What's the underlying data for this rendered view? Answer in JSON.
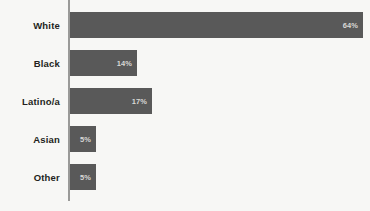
{
  "chart_data": {
    "type": "bar",
    "orientation": "horizontal",
    "title": "",
    "subtitle": "",
    "xlabel": "",
    "ylabel": "",
    "grid": false,
    "legend": false,
    "xlim": [
      0,
      64
    ],
    "categories": [
      "White",
      "Black",
      "Latino/a",
      "Asian",
      "Other"
    ],
    "values": [
      64,
      14,
      17,
      5,
      5
    ],
    "value_labels": [
      "64%",
      "14%",
      "17%",
      "5%",
      "5%"
    ],
    "series": [
      {
        "name": "",
        "values": [
          64,
          14,
          17,
          5,
          5
        ]
      }
    ],
    "colors": {
      "bar": "#595959",
      "background": "#f7f7f5",
      "axis_line": "#9a9a98",
      "category_label": "#231f20",
      "value_label": "#d8d8d6"
    }
  },
  "bars": [
    {
      "label": "White",
      "value_label": "64%",
      "width_px": 293,
      "top_px": 12,
      "height_px": 26
    },
    {
      "label": "Black",
      "value_label": "14%",
      "width_px": 67,
      "top_px": 50,
      "height_px": 26
    },
    {
      "label": "Latino/a",
      "value_label": "17%",
      "width_px": 82,
      "top_px": 88,
      "height_px": 26
    },
    {
      "label": "Asian",
      "value_label": "5%",
      "width_px": 26,
      "top_px": 126,
      "height_px": 26
    },
    {
      "label": "Other",
      "value_label": "5%",
      "width_px": 26,
      "top_px": 164,
      "height_px": 26
    }
  ]
}
